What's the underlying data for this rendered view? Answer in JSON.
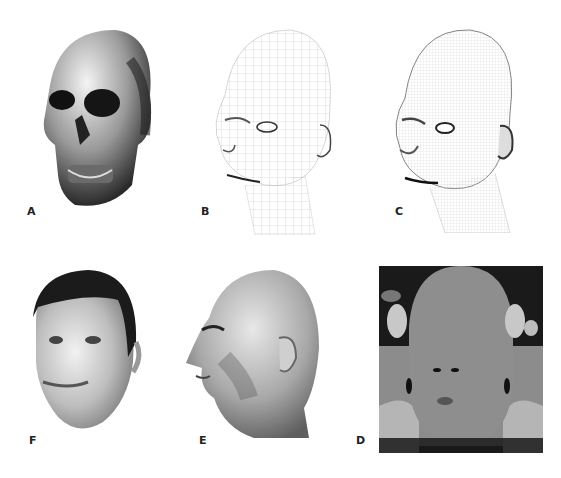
{
  "figure": {
    "panels": [
      {
        "id": "A",
        "label": "A",
        "content": "skull"
      },
      {
        "id": "B",
        "label": "B",
        "content": "head wireframe coarse mesh"
      },
      {
        "id": "C",
        "label": "C",
        "content": "head wireframe dense mesh"
      },
      {
        "id": "D",
        "label": "D",
        "content": "unwrapped skin texture map"
      },
      {
        "id": "E",
        "label": "E",
        "content": "textured head profile"
      },
      {
        "id": "F",
        "label": "F",
        "content": "textured head with hair, frontal 3/4"
      }
    ]
  },
  "colors": {
    "background": "#ffffff",
    "label": "#222222",
    "texture_dark": "#1a1a1a",
    "texture_mid": "#8c8c8c",
    "texture_light": "#b5b5b5"
  }
}
